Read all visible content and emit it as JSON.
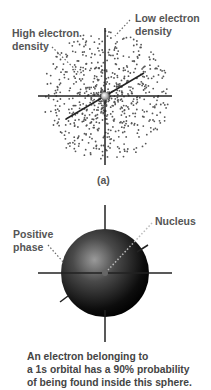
{
  "figure_a": {
    "panel_label": "(a)",
    "labels": {
      "high_density": [
        "High electron",
        "density"
      ],
      "low_density": [
        "Low electron",
        "density"
      ]
    }
  },
  "figure_b": {
    "labels": {
      "positive_phase": [
        "Positive",
        "phase"
      ],
      "nucleus": "Nucleus"
    },
    "caption": [
      "An electron belonging to",
      "a 1s orbital has a 90% probability",
      "of being found inside this sphere."
    ]
  },
  "colors": {
    "dots": "#555555",
    "axes": "#222222",
    "text": "#555555",
    "sphere_dark": "#000000",
    "sphere_light": "#8a8a8a"
  }
}
